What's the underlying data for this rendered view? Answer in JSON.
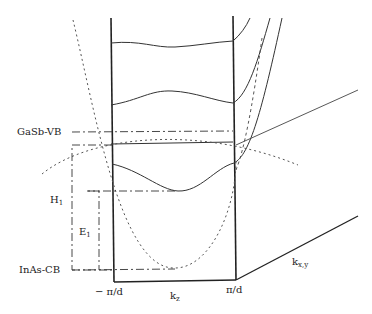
{
  "diagram": {
    "type": "band-structure",
    "labels": {
      "gasb_vb": "GaSb-VB",
      "inas_cb": "InAs-CB",
      "h1": "H",
      "h1_sub": "1",
      "e1": "E",
      "e1_sub": "1",
      "neg_pi_d": "− π/d",
      "pi_d": "π/d",
      "kz": "k",
      "kz_sub": "z",
      "kxy": "k",
      "kxy_sub": "x,y"
    },
    "colors": {
      "line": "#222222",
      "dashed": "#555555",
      "background": "#ffffff"
    }
  }
}
